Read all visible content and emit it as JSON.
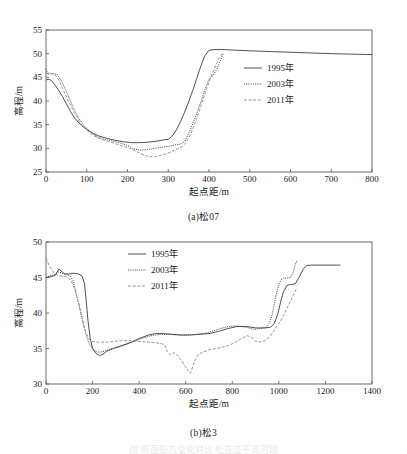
{
  "figures": [
    {
      "id": "a",
      "caption": "(a)松07",
      "chart_index": 0
    },
    {
      "id": "b",
      "caption": "(b)松3",
      "chart_index": 1
    }
  ],
  "bottom_text": "图    断面形态变化对比  松花江干流河段",
  "chart_data": [
    {
      "type": "line",
      "title": "(a)松07",
      "xlabel": "起点距/m",
      "ylabel": "高程/m",
      "xlim": [
        0,
        800
      ],
      "ylim": [
        25,
        55
      ],
      "xticks": [
        0,
        100,
        200,
        300,
        400,
        500,
        600,
        700,
        800
      ],
      "xtick_labels": [
        "0",
        "100",
        "200",
        "300",
        "400",
        "500",
        "600",
        "700",
        "800"
      ],
      "yticks": [
        25,
        30,
        35,
        40,
        45,
        50,
        55
      ],
      "ytick_labels": [
        "25",
        "30",
        "35",
        "40",
        "45",
        "50",
        "55"
      ],
      "grid": false,
      "legend_position": "center-right",
      "series": [
        {
          "name": "1995年",
          "style": "solid",
          "color": "#3d3d3d",
          "x": [
            0,
            5,
            12,
            20,
            30,
            40,
            50,
            60,
            70,
            85,
            100,
            115,
            130,
            150,
            170,
            190,
            210,
            230,
            250,
            270,
            290,
            300,
            310,
            320,
            330,
            340,
            350,
            360,
            370,
            380,
            390,
            400,
            410,
            430,
            450,
            500,
            550,
            600,
            650,
            700,
            750,
            800
          ],
          "y": [
            44.4,
            44.6,
            44.4,
            43.6,
            42.4,
            41.0,
            39.4,
            37.8,
            36.4,
            35.0,
            34.0,
            33.2,
            32.6,
            32.1,
            31.7,
            31.4,
            31.2,
            31.2,
            31.3,
            31.5,
            31.8,
            31.9,
            32.6,
            33.9,
            35.6,
            37.6,
            39.8,
            42.2,
            44.8,
            47.4,
            49.6,
            50.7,
            50.85,
            50.9,
            50.8,
            50.6,
            50.45,
            50.3,
            50.15,
            50.0,
            49.9,
            49.8
          ]
        },
        {
          "name": "2003年",
          "style": "dotted",
          "color": "#3d3d3d",
          "x": [
            0,
            4,
            10,
            18,
            28,
            38,
            48,
            58,
            68,
            80,
            95,
            110,
            125,
            140,
            160,
            180,
            200,
            215,
            230,
            245,
            260,
            275,
            290,
            305,
            320,
            330,
            340,
            350,
            360,
            370,
            380,
            390,
            400,
            410,
            420,
            430,
            435
          ],
          "y": [
            46.8,
            45.6,
            45.8,
            45.8,
            45.6,
            44.2,
            42.4,
            40.4,
            38.4,
            36.4,
            34.6,
            33.4,
            32.5,
            32.0,
            31.6,
            31.2,
            30.6,
            29.9,
            29.6,
            29.7,
            29.9,
            30.1,
            30.3,
            30.5,
            30.8,
            30.9,
            31.4,
            33.1,
            35.2,
            37.4,
            39.8,
            42.4,
            44.6,
            45.4,
            46.9,
            49.0,
            50.0
          ]
        },
        {
          "name": "2011年",
          "style": "dashed",
          "color": "#8a8a8a",
          "x": [
            0,
            5,
            12,
            22,
            32,
            42,
            55,
            70,
            85,
            100,
            115,
            130,
            150,
            170,
            190,
            205,
            220,
            235,
            250,
            260,
            270,
            285,
            300,
            315,
            325,
            335,
            345,
            355,
            365,
            375,
            385,
            395,
            405,
            415,
            425,
            432
          ],
          "y": [
            45.8,
            45.9,
            45.8,
            45.6,
            44.4,
            42.4,
            40.0,
            37.4,
            35.2,
            33.8,
            32.8,
            32.1,
            31.5,
            31.0,
            30.4,
            30.0,
            29.4,
            28.8,
            28.3,
            28.2,
            28.3,
            28.6,
            29.0,
            29.6,
            30.0,
            30.4,
            31.4,
            33.0,
            35.2,
            37.6,
            40.2,
            42.8,
            45.2,
            47.2,
            49.0,
            49.9
          ]
        }
      ]
    },
    {
      "type": "line",
      "title": "(b)松3",
      "xlabel": "起点距/m",
      "ylabel": "高程/m",
      "xlim": [
        0,
        1400
      ],
      "ylim": [
        30,
        50
      ],
      "xticks": [
        0,
        200,
        400,
        600,
        800,
        1000,
        1200,
        1400
      ],
      "xtick_labels": [
        "0",
        "200",
        "400",
        "600",
        "800",
        "1000",
        "1200",
        "1400"
      ],
      "yticks": [
        30,
        35,
        40,
        45,
        50
      ],
      "ytick_labels": [
        "30",
        "35",
        "40",
        "45",
        "50"
      ],
      "grid": false,
      "legend_position": "upper-center-left",
      "series": [
        {
          "name": "1995年",
          "style": "solid",
          "color": "#3d3d3d",
          "x": [
            0,
            20,
            40,
            55,
            65,
            80,
            100,
            120,
            140,
            155,
            165,
            172,
            180,
            190,
            200,
            215,
            230,
            245,
            260,
            290,
            320,
            360,
            400,
            440,
            470,
            500,
            540,
            580,
            620,
            660,
            700,
            740,
            780,
            820,
            860,
            900,
            940,
            965,
            980,
            995,
            1010,
            1020,
            1035,
            1050,
            1070,
            1090,
            1105,
            1120,
            1140,
            1180,
            1230,
            1265
          ],
          "y": [
            45.0,
            45.1,
            45.3,
            46.2,
            45.9,
            45.5,
            45.5,
            45.6,
            45.5,
            45.2,
            44.2,
            42.0,
            39.0,
            36.4,
            35.0,
            34.3,
            34.0,
            34.2,
            34.6,
            35.0,
            35.3,
            35.8,
            36.4,
            36.9,
            37.1,
            37.1,
            37.0,
            36.9,
            36.9,
            37.0,
            37.1,
            37.4,
            37.8,
            38.1,
            38.1,
            37.9,
            37.9,
            38.0,
            38.5,
            39.8,
            41.9,
            43.0,
            43.9,
            44.0,
            44.1,
            45.2,
            46.2,
            46.7,
            46.75,
            46.75,
            46.75,
            46.75
          ]
        },
        {
          "name": "2003年",
          "style": "dotted",
          "color": "#3d3d3d",
          "x": [
            0,
            15,
            35,
            55,
            70,
            90,
            105,
            115,
            125,
            135,
            148,
            160,
            175,
            190,
            205,
            220,
            235,
            250,
            275,
            300,
            330,
            370,
            410,
            450,
            490,
            530,
            570,
            610,
            650,
            690,
            730,
            770,
            800,
            830,
            860,
            890,
            920,
            945,
            960,
            970,
            980,
            990,
            1000,
            1010,
            1020,
            1035,
            1050,
            1060,
            1070,
            1078
          ],
          "y": [
            45.0,
            45.2,
            45.4,
            45.8,
            45.6,
            45.4,
            45.2,
            44.6,
            43.4,
            42.0,
            40.2,
            38.4,
            36.6,
            35.4,
            34.8,
            34.5,
            34.5,
            34.6,
            34.9,
            35.2,
            35.5,
            35.9,
            36.4,
            36.8,
            37.0,
            37.0,
            36.9,
            36.9,
            37.0,
            37.2,
            37.6,
            38.0,
            38.15,
            38.15,
            38.0,
            37.7,
            37.8,
            38.0,
            38.6,
            39.6,
            41.2,
            42.8,
            44.0,
            44.7,
            44.9,
            44.9,
            45.0,
            45.6,
            46.8,
            47.4
          ]
        },
        {
          "name": "2011年",
          "style": "dashed",
          "color": "#8a8a8a",
          "x": [
            0,
            15,
            35,
            55,
            75,
            95,
            110,
            125,
            140,
            155,
            170,
            185,
            200,
            220,
            240,
            265,
            290,
            320,
            360,
            400,
            440,
            470,
            495,
            510,
            520,
            535,
            550,
            565,
            580,
            595,
            610,
            620,
            630,
            640,
            655,
            675,
            700,
            730,
            760,
            790,
            820,
            845,
            865,
            885,
            900,
            920,
            940,
            960,
            980,
            1000,
            1020,
            1040,
            1060,
            1075
          ],
          "y": [
            47.7,
            46.6,
            45.6,
            45.2,
            45.2,
            45.0,
            44.4,
            43.2,
            41.4,
            39.4,
            37.4,
            36.3,
            36.0,
            35.9,
            35.9,
            35.9,
            36.0,
            36.1,
            36.1,
            36.0,
            35.9,
            35.8,
            35.7,
            35.5,
            34.6,
            34.1,
            34.4,
            34.0,
            33.4,
            32.6,
            31.9,
            31.5,
            32.4,
            33.4,
            34.2,
            34.5,
            34.8,
            35.0,
            35.2,
            35.5,
            36.0,
            36.5,
            36.8,
            36.5,
            36.0,
            35.9,
            36.1,
            36.6,
            37.6,
            38.5,
            39.6,
            41.0,
            42.4,
            43.4
          ]
        }
      ]
    }
  ]
}
